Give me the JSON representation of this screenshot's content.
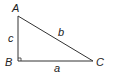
{
  "diagram": {
    "type": "right-triangle",
    "vertices": [
      {
        "label": "A",
        "x": 18,
        "y": 16
      },
      {
        "label": "B",
        "x": 18,
        "y": 61
      },
      {
        "label": "C",
        "x": 93,
        "y": 61
      }
    ],
    "sides": [
      {
        "label": "a",
        "between": "B-C"
      },
      {
        "label": "b",
        "between": "A-C"
      },
      {
        "label": "c",
        "between": "A-B"
      }
    ],
    "right_angle_at": "B",
    "colors": {
      "stroke": "#333333",
      "text": "#222222"
    }
  }
}
